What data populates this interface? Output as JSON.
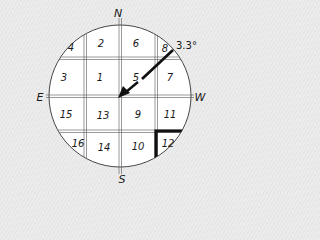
{
  "diagram": {
    "type": "compass-grid",
    "compass": {
      "north": "N",
      "south": "S",
      "east": "E",
      "west": "W"
    },
    "angle_label": "3.3°",
    "highlighted_cell": "12",
    "cells": [
      {
        "id": "4",
        "x": 71,
        "y": 51
      },
      {
        "id": "2",
        "x": 101,
        "y": 47
      },
      {
        "id": "6",
        "x": 136,
        "y": 47
      },
      {
        "id": "8",
        "x": 165,
        "y": 52
      },
      {
        "id": "3",
        "x": 64,
        "y": 81
      },
      {
        "id": "1",
        "x": 100,
        "y": 81
      },
      {
        "id": "5",
        "x": 136,
        "y": 81
      },
      {
        "id": "7",
        "x": 170,
        "y": 81
      },
      {
        "id": "15",
        "x": 66,
        "y": 118
      },
      {
        "id": "13",
        "x": 103,
        "y": 119
      },
      {
        "id": "9",
        "x": 138,
        "y": 118
      },
      {
        "id": "11",
        "x": 170,
        "y": 118
      },
      {
        "id": "16",
        "x": 78,
        "y": 147
      },
      {
        "id": "14",
        "x": 104,
        "y": 151
      },
      {
        "id": "10",
        "x": 138,
        "y": 150
      },
      {
        "id": "12",
        "x": 168,
        "y": 147
      }
    ],
    "colors": {
      "line": "#1a1a1a",
      "grid": "#555555",
      "circle_fill": "#ffffff"
    }
  }
}
